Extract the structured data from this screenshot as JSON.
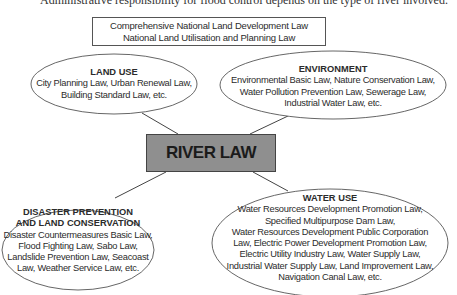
{
  "caption": "Administrative responsibility for flood control depends on the type of river involved.",
  "top_box": {
    "line1": "Comprehensive National Land Development Law",
    "line2": "National Land Utilisation and Planning Law"
  },
  "center": {
    "label": "RIVER LAW",
    "fill": "#8f8f8f"
  },
  "nodes": {
    "land_use": {
      "title": "LAND USE",
      "lines": [
        "City Planning Law, Urban Renewal Law,",
        "Building Standard Law, etc."
      ]
    },
    "environment": {
      "title": "ENVIRONMENT",
      "lines": [
        "Environmental Basic Law, Nature Conservation Law,",
        "Water Pollution Prevention Law, Sewerage Law,",
        "Industrial Water Law, etc."
      ]
    },
    "disaster": {
      "title1": "DISASTER PREVENTION",
      "title2": "AND LAND CONSERVATION",
      "lines": [
        "Disaster Countermeasures Basic Law,",
        "Flood Fighting Law, Sabo Law,",
        "Landslide Prevention Law, Seacoast",
        "Law, Weather Service Law, etc."
      ]
    },
    "water_use": {
      "title": "WATER USE",
      "lines": [
        "Water Resources Development Promotion Law,",
        "Specified Multipurpose Dam Law,",
        "Water Resources Development Public Corporation",
        "Law, Electric Power Development Promotion Law,",
        "Electric Utility Industry Law, Water Supply Law,",
        "Industrial Water Supply Law, Land Improvement Law,",
        "Navigation Canal Law, etc."
      ]
    }
  }
}
